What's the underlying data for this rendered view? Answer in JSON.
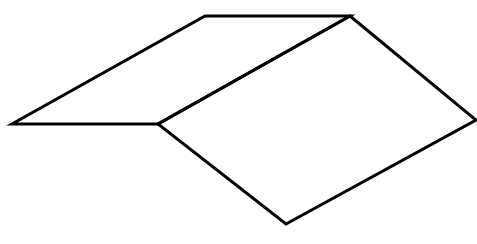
{
  "diagram": {
    "stroke_color": "#000000",
    "background": "#ffffff",
    "stroke_width": 3,
    "vertices": {
      "top_left": [
        205,
        16
      ],
      "top_right": [
        350,
        16
      ],
      "left": [
        12,
        124
      ],
      "middle": [
        158,
        124
      ],
      "right": [
        476,
        120
      ],
      "bottom": [
        286,
        224
      ]
    },
    "faces": [
      {
        "name": "left-face",
        "points": "205,16 350,16 158,124 12,124"
      },
      {
        "name": "right-face",
        "points": "350,16 476,120 286,224 158,124"
      }
    ]
  }
}
